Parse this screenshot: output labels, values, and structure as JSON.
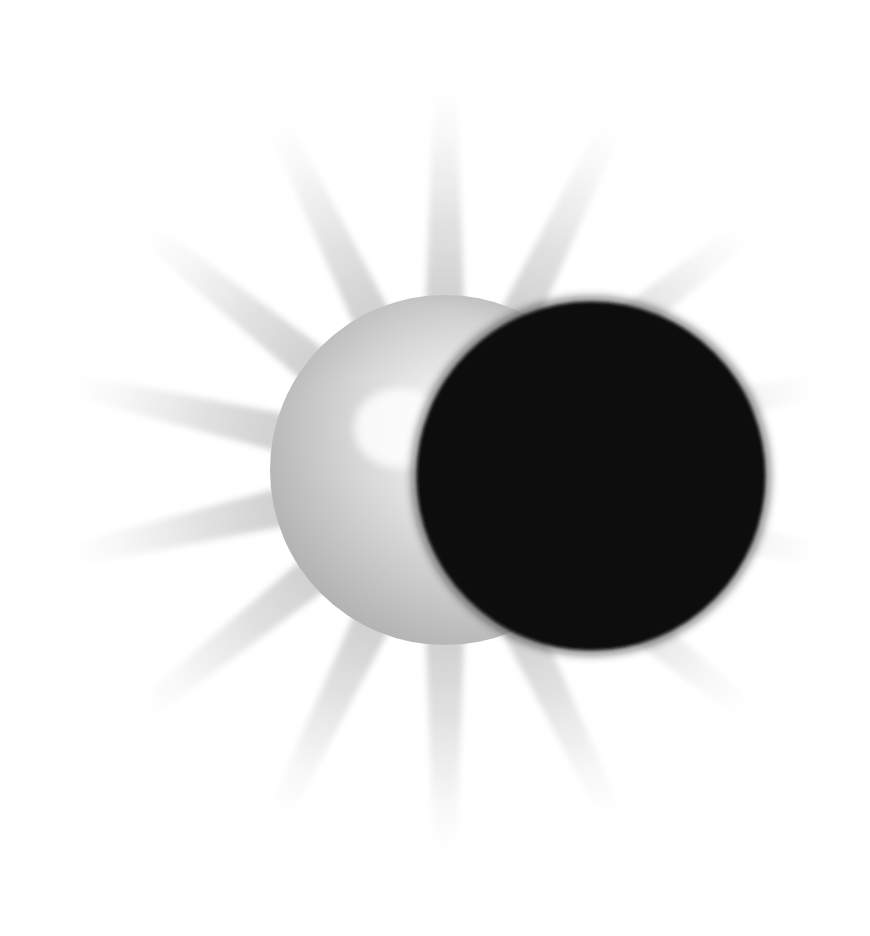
{
  "page": {
    "width": 870,
    "height": 936,
    "background_color": "#ffffff"
  },
  "divider": {
    "name": "top-horizontal-rule",
    "color": "#3a3a3a",
    "x": 37,
    "y": 26,
    "width": 829,
    "height": 3
  },
  "illustration": {
    "title": "Solar eclipse",
    "description": "A bright sphere representing the Sun with a radiating corona of pale grey rays, partially covered from the right by a solid black sphere representing the Moon.",
    "background_color": "#ffffff",
    "corona": {
      "name": "corona-rays",
      "ray_count": 14,
      "color_inner": "#cfcfcf",
      "color_outer": "#ffffff",
      "center_x": 445,
      "center_y": 470,
      "inner_radius": 150,
      "outer_radius": 400,
      "half_angle_deg": 7.5,
      "start_angle_deg": -90
    },
    "sun": {
      "name": "sun-sphere",
      "center_x": 445,
      "center_y": 470,
      "radius": 175,
      "highlight_x": 400,
      "highlight_y": 428,
      "highlight_color": "#ffffff",
      "mid_color": "#d8d8d8",
      "edge_color": "#a8a8a8",
      "rim_color": "#9a9a9a"
    },
    "moon": {
      "name": "moon-disc",
      "center_x": 591,
      "center_y": 476,
      "radius": 174,
      "fill_color": "#0b0b0b",
      "limb_shadow_color": "#2a2a2a",
      "terminator_color": "#000000"
    }
  }
}
